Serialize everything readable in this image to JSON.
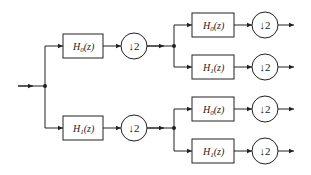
{
  "diagram": {
    "type": "two-level tree-structured analysis filter bank",
    "input": {
      "node": "x"
    },
    "stage1": {
      "upper": {
        "filter_label": "H0(z)",
        "filter_base": "H",
        "filter_sub": "0",
        "filter_arg": "(z)",
        "decimator_label": "↓2"
      },
      "lower": {
        "filter_label": "H1(z)",
        "filter_base": "H",
        "filter_sub": "1",
        "filter_arg": "(z)",
        "decimator_label": "↓2"
      }
    },
    "stage2": {
      "upper_upper": {
        "filter_base": "H",
        "filter_sub": "0",
        "filter_arg": "(z)",
        "decimator_label": "↓2"
      },
      "upper_lower": {
        "filter_base": "H",
        "filter_sub": "1",
        "filter_arg": "(z)",
        "decimator_label": "↓2"
      },
      "lower_upper": {
        "filter_base": "H",
        "filter_sub": "0",
        "filter_arg": "(z)",
        "decimator_label": "↓2"
      },
      "lower_lower": {
        "filter_base": "H",
        "filter_sub": "1",
        "filter_arg": "(z)",
        "decimator_label": "↓2"
      }
    },
    "colors": {
      "stroke": "#222222",
      "background": "#ffffff"
    }
  }
}
